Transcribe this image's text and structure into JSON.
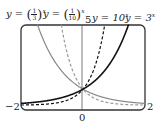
{
  "chart_data": {
    "type": "line",
    "title": "",
    "xlabel": "",
    "ylabel": "",
    "xlim": [
      -2,
      2
    ],
    "ylim": [
      -0.3,
      5
    ],
    "ylim_note": "Approximate. Only the '5' label near the top of the axis and the curve intersection at y=1 were checked; the vertical scale was not verified against tick positions.",
    "grid": false,
    "x_tick_labels": [
      "-2",
      "0",
      "2"
    ],
    "y_tick_labels": [
      "5"
    ],
    "x": [
      -2,
      -1.5,
      -1,
      -0.5,
      0,
      0.5,
      1,
      1.5,
      2
    ],
    "values_note": "Series values are computed from the function definitions, not read from the plot.",
    "series": [
      {
        "name": "y = (1/3)^x",
        "style": "solid gray",
        "values": [
          9,
          5.196,
          3,
          1.732,
          1,
          0.577,
          0.333,
          0.192,
          0.111
        ]
      },
      {
        "name": "y = (1/10)^x",
        "style": "dashed gray",
        "values": [
          100,
          31.62,
          10,
          3.162,
          1,
          0.316,
          0.1,
          0.032,
          0.01
        ]
      },
      {
        "name": "y = 10^x",
        "style": "dashed black",
        "values": [
          0.01,
          0.032,
          0.1,
          0.316,
          1,
          3.162,
          10,
          31.62,
          100
        ]
      },
      {
        "name": "y = 3^x",
        "style": "solid black",
        "values": [
          0.111,
          0.192,
          0.333,
          0.577,
          1,
          1.732,
          3,
          5.196,
          9
        ]
      }
    ]
  },
  "labels": {
    "l1_prefix": "y = ",
    "l1_num": "1",
    "l1_den": "3",
    "l1_exp": "x",
    "l2_prefix": "y = ",
    "l2_num": "1",
    "l2_den": "10",
    "l2_exp": "x",
    "ymax_tick": "5",
    "l3": "y = 10",
    "l3_exp": "x",
    "l4": "y = 3",
    "l4_exp": "x",
    "xmin_tick": "−2",
    "xmax_tick": "2",
    "origin_tick": "0"
  }
}
